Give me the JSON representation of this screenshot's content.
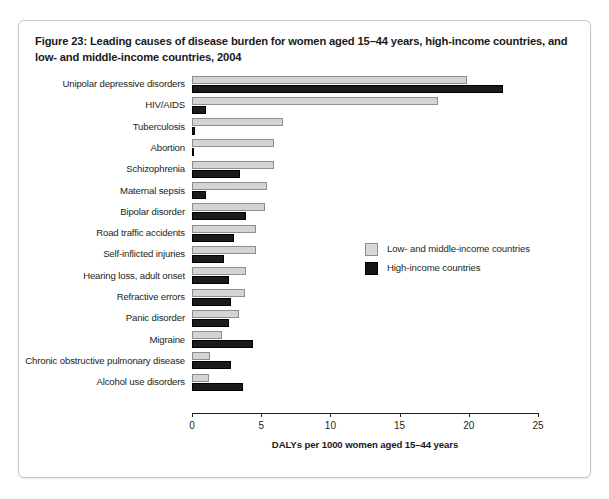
{
  "figure": {
    "title": "Figure 23: Leading causes of disease burden for women aged 15–44 years, high-income countries, and low- and middle-income countries, 2004"
  },
  "legend": {
    "position": "inside-right",
    "entries": [
      {
        "label": "Low- and middle-income countries",
        "swatch": "light-grey-square",
        "color": "#d8d8d8"
      },
      {
        "label": "High-income countries",
        "swatch": "black-square",
        "color": "#151515"
      }
    ]
  },
  "chart_data": {
    "type": "bar",
    "orientation": "horizontal",
    "title": "Figure 23: Leading causes of disease burden for women aged 15–44 years, high-income countries, and low- and middle-income countries, 2004",
    "xlabel": "DALYs per 1000 women aged 15–44 years",
    "ylabel": "",
    "xlim": [
      0,
      25
    ],
    "xticks": [
      0,
      5,
      10,
      15,
      20,
      25
    ],
    "xtick_labels": [
      "0",
      "5",
      "10",
      "15",
      "20",
      "25"
    ],
    "grid": false,
    "categories": [
      "Unipolar depressive disorders",
      "HIV/AIDS",
      "Tuberculosis",
      "Abortion",
      "Schizophrenia",
      "Maternal sepsis",
      "Bipolar disorder",
      "Road traffic accidents",
      "Self-inflicted injuries",
      "Hearing loss, adult onset",
      "Refractive errors",
      "Panic disorder",
      "Migraine",
      "Chronic obstructive pulmonary disease",
      "Alcohol use disorders"
    ],
    "series": [
      {
        "name": "Low- and middle-income countries",
        "color": "#d4d4d4",
        "values": [
          19.9,
          17.8,
          6.6,
          5.9,
          5.9,
          5.4,
          5.3,
          4.6,
          4.6,
          3.9,
          3.8,
          3.4,
          2.2,
          1.3,
          1.2
        ]
      },
      {
        "name": "High-income countries",
        "color": "#1b1b1b",
        "values": [
          22.5,
          1.0,
          0.2,
          0.1,
          3.5,
          1.0,
          3.9,
          3.0,
          2.3,
          2.7,
          2.8,
          2.7,
          4.4,
          2.8,
          3.7
        ]
      }
    ]
  }
}
